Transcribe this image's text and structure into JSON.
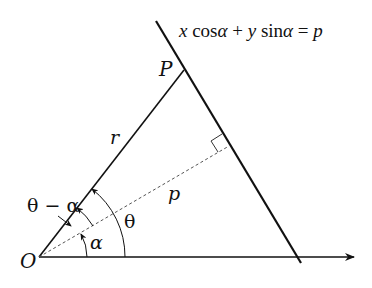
{
  "diagram": {
    "equation": {
      "x": "x",
      "cos": "cos",
      "alpha1": "α",
      "plus": "+",
      "y": "y",
      "sin": "sin",
      "alpha2": "α",
      "eq": "=",
      "p": "p"
    },
    "labels": {
      "origin": "O",
      "point": "P",
      "radius": "r",
      "perpendicular": "p",
      "theta": "θ",
      "alpha": "α",
      "theta_minus_alpha": "θ − α"
    },
    "colors": {
      "stroke": "#111111",
      "dashed": "#555555",
      "background": "#ffffff"
    }
  }
}
